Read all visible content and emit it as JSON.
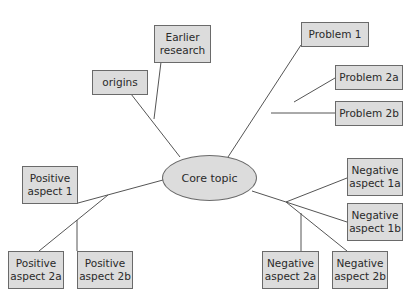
{
  "diagram": {
    "type": "mind-map",
    "center": {
      "label": "Core topic"
    },
    "nodes": [
      {
        "id": "origins",
        "label": "origins"
      },
      {
        "id": "earlier_research",
        "label": "Earlier\nresearch"
      },
      {
        "id": "problem1",
        "label": "Problem 1"
      },
      {
        "id": "problem2a",
        "label": "Problem 2a"
      },
      {
        "id": "problem2b",
        "label": "Problem 2b"
      },
      {
        "id": "positive1",
        "label": "Positive\naspect 1"
      },
      {
        "id": "positive2a",
        "label": "Positive\naspect 2a"
      },
      {
        "id": "positive2b",
        "label": "Positive\naspect 2b"
      },
      {
        "id": "negative1a",
        "label": "Negative\naspect 1a"
      },
      {
        "id": "negative1b",
        "label": "Negative\naspect 1b"
      },
      {
        "id": "negative2a",
        "label": "Negative\naspect 2a"
      },
      {
        "id": "negative2b",
        "label": "Negative\naspect 2b"
      }
    ],
    "colors": {
      "box_fill": "#dcdcdc",
      "border": "#6a6a6a",
      "line": "#555555",
      "text": "#2a2a2a"
    }
  }
}
